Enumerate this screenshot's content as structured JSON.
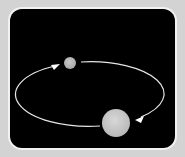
{
  "diagram": {
    "title": "",
    "colors": {
      "background": "#d3d3d3",
      "frame": "#f2f2f2",
      "panel": "#000000",
      "orbit": "#e6e6e6",
      "small_body": "#b8b8b8",
      "large_body": "#cfcfcf"
    },
    "orbit": {
      "cx": 92.5,
      "cy": 94,
      "rx": 73.5,
      "ry": 32,
      "direction": "counter-clockwise (arrows)"
    },
    "bodies": [
      {
        "name": "small-body",
        "cx": 70,
        "cy": 63,
        "r": 6
      },
      {
        "name": "large-body",
        "cx": 116,
        "cy": 123,
        "r": 14
      }
    ],
    "arrows": [
      {
        "name": "arrow-upper-left",
        "tip": [
          57,
          65
        ]
      },
      {
        "name": "arrow-lower-right",
        "tip": [
          138,
          118
        ]
      }
    ]
  }
}
